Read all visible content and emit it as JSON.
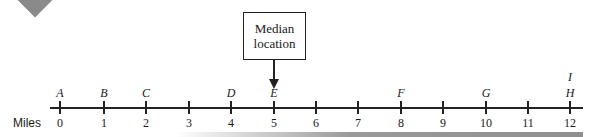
{
  "diagram": {
    "axis_title": "Miles",
    "callout": {
      "line1": "Median",
      "line2": "location",
      "points_to": "E"
    },
    "ticks": [
      {
        "value": "0",
        "x": 60
      },
      {
        "value": "1",
        "x": 104
      },
      {
        "value": "2",
        "x": 146
      },
      {
        "value": "3",
        "x": 189
      },
      {
        "value": "4",
        "x": 231
      },
      {
        "value": "5",
        "x": 274
      },
      {
        "value": "6",
        "x": 316
      },
      {
        "value": "7",
        "x": 358
      },
      {
        "value": "8",
        "x": 401
      },
      {
        "value": "9",
        "x": 443
      },
      {
        "value": "10",
        "x": 486
      },
      {
        "value": "11",
        "x": 528
      },
      {
        "value": "12",
        "x": 570
      }
    ],
    "points": [
      {
        "label": "A",
        "mile": 0
      },
      {
        "label": "B",
        "mile": 1
      },
      {
        "label": "C",
        "mile": 2
      },
      {
        "label": "D",
        "mile": 4
      },
      {
        "label": "E",
        "mile": 5
      },
      {
        "label": "F",
        "mile": 8
      },
      {
        "label": "G",
        "mile": 10
      },
      {
        "label": "H",
        "mile": 12
      },
      {
        "label": "I",
        "mile": 12
      }
    ]
  }
}
